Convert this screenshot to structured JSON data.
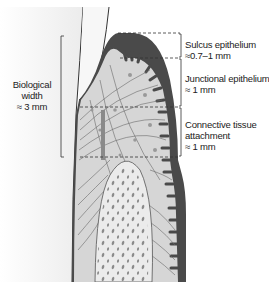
{
  "diagram": {
    "title": "Biological width",
    "left_label": {
      "line1": "Biological",
      "line2": "width",
      "line3": "≈ 3 mm"
    },
    "zones": [
      {
        "name": "Sulcus epithelium",
        "value": "≈0.7–1 mm"
      },
      {
        "name": "Junctional epithelium",
        "value": "≈ 1 mm"
      },
      {
        "name": "Connective tissue",
        "name2": "attachment",
        "value": "≈ 1 mm"
      }
    ],
    "colors": {
      "gingiva_outer": "#4a4a4a",
      "connective_tissue": "#d6d6d6",
      "bone": "#ebebeb",
      "tooth": "#f2f2f2",
      "line": "#333333"
    }
  }
}
